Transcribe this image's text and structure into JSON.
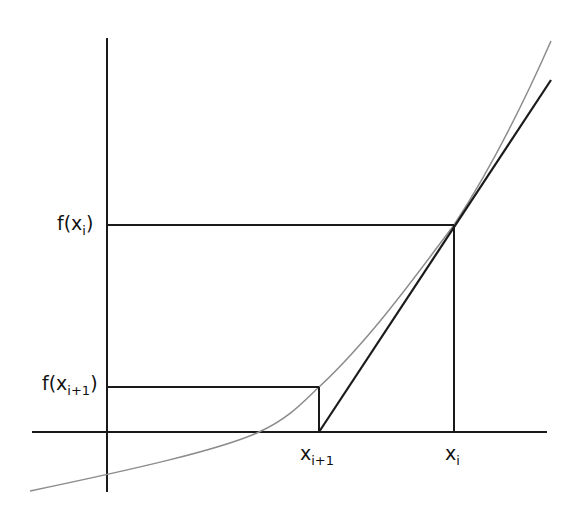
{
  "diagram": {
    "colors": {
      "background": "#ffffff",
      "axes": "#1a1a1a",
      "guides": "#1a1a1a",
      "tangent": "#1a1a1a",
      "curve": "#8c8c8c",
      "text": "#111111"
    },
    "labels": {
      "f_xi": {
        "base": "f(x",
        "sub": "i",
        "close": ")"
      },
      "f_xi1": {
        "base": "f(x",
        "sub": "i+1",
        "close": ")"
      },
      "xi": {
        "base": "x",
        "sub": "i"
      },
      "xi1": {
        "base": "x",
        "sub": "i+1"
      }
    },
    "geometry": {
      "y_axis": {
        "x": 107,
        "y1": 38,
        "y2": 492
      },
      "x_axis": {
        "y": 432,
        "x1": 32,
        "x2": 547
      },
      "point_i": {
        "x": 454,
        "y": 225
      },
      "point_i1": {
        "x": 319,
        "y": 387
      },
      "tangent": {
        "x1": 319,
        "y1": 432,
        "x2": 551,
        "y2": 80
      },
      "curve_path": "M 30 491 C 130 470, 220 450, 259 432 C 290 418, 305 400, 319 387 C 370 340, 420 270, 454 225 C 490 170, 525 100, 551 41"
    }
  }
}
